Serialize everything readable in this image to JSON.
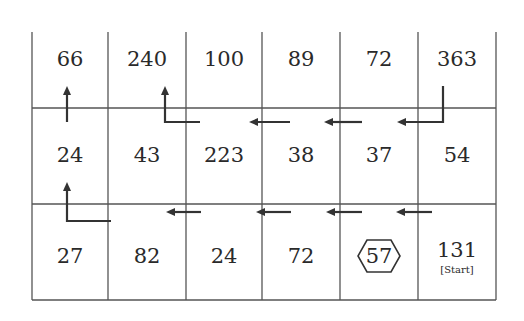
{
  "grid": {
    "rows": [
      [
        {
          "value": "66"
        },
        {
          "value": "240"
        },
        {
          "value": "100"
        },
        {
          "value": "89"
        },
        {
          "value": "72"
        },
        {
          "value": "363"
        }
      ],
      [
        {
          "value": "24"
        },
        {
          "value": "43"
        },
        {
          "value": "223"
        },
        {
          "value": "38"
        },
        {
          "value": "37"
        },
        {
          "value": "54"
        }
      ],
      [
        {
          "value": "27"
        },
        {
          "value": "82"
        },
        {
          "value": "24"
        },
        {
          "value": "72"
        },
        {
          "value": "57",
          "marked": "hexagon"
        },
        {
          "value": "131",
          "label": "[Start]"
        }
      ]
    ],
    "start_label": "[Start]",
    "marked_value": "57"
  },
  "path": {
    "description": "Path from Start (131) moving left along bottom row, up to middle row, left, then up to 66 and 240",
    "arrows": [
      "left",
      "left",
      "left",
      "left",
      "up-bend",
      "up",
      "left",
      "left",
      "left",
      "up-bend",
      "up"
    ]
  },
  "colors": {
    "line": "#555555",
    "text": "#2a2a2a",
    "arrow": "#333333"
  }
}
